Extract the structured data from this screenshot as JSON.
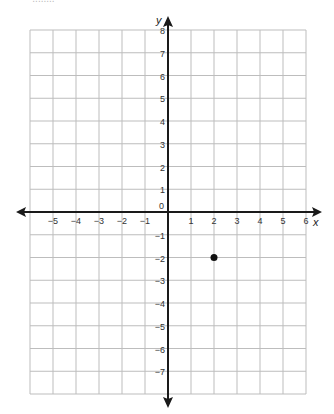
{
  "header_fragment": "· · ·   ........",
  "chart_data": {
    "type": "scatter",
    "title": "",
    "xlabel": "x",
    "ylabel": "y",
    "xlim": [
      -6,
      6
    ],
    "ylim": [
      -8,
      8
    ],
    "grid": true,
    "x_ticks": [
      -5,
      -4,
      -3,
      -2,
      -1,
      1,
      2,
      3,
      4,
      5,
      6
    ],
    "y_ticks": [
      8,
      7,
      6,
      5,
      4,
      3,
      2,
      1,
      -1,
      -2,
      -3,
      -4,
      -5,
      -6,
      -7
    ],
    "origin_label": "0",
    "points": [
      {
        "x": 2,
        "y": -2
      }
    ],
    "colors": {
      "grid": "#bdbdbd",
      "axis": "#1a1a1a",
      "point": "#111111"
    }
  }
}
